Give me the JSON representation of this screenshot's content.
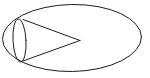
{
  "figure": {
    "background_color": "#ffffff",
    "stroke_color": "#1c1c1c",
    "stroke_width": 1,
    "canvas": {
      "width": 150,
      "height": 78
    },
    "shapes": {
      "outer_ellipse": {
        "label": "outer ellipse",
        "cx": 72,
        "cy": 38,
        "rx": 69.5,
        "ry": 33.5,
        "rotation": -1
      },
      "cone_base_ellipse": {
        "label": "cone base ellipse",
        "cx": 19.5,
        "cy": 40.5,
        "rx": 6.5,
        "ry": 21.5,
        "rotation": -3
      },
      "cone_upper_edge": {
        "label": "cone upper slant edge",
        "x1": 23,
        "y1": 19.5,
        "x2": 80,
        "y2": 40.5
      },
      "cone_lower_edge": {
        "label": "cone lower slant edge",
        "x1": 21.5,
        "y1": 61.5,
        "x2": 80,
        "y2": 40.5
      },
      "cone_apex": {
        "label": "cone apex",
        "x": 80,
        "y": 40.5
      }
    }
  }
}
